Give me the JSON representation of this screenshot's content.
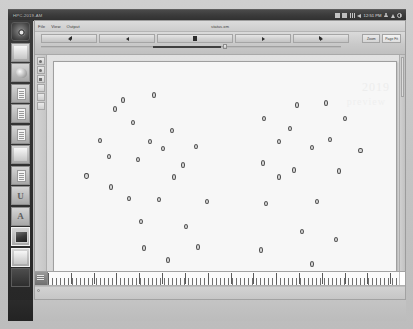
{
  "window": {
    "title": "HPC-2019-AM",
    "document_label": "status.xm"
  },
  "top_panel": {
    "tray": {
      "icons": [
        "grid-icon",
        "battery-icon",
        "signal-bars-icon",
        "volume-icon",
        "user-icon",
        "power-icon"
      ],
      "clock": "12:51 PM"
    }
  },
  "dock": {
    "items": [
      {
        "name": "dock-item-system-settings",
        "icon": "gear-dark-icon"
      },
      {
        "name": "dock-item-blank-1",
        "icon": "panel-icon"
      },
      {
        "name": "dock-item-media",
        "icon": "blob-icon"
      },
      {
        "name": "dock-item-document-1",
        "icon": "document-icon"
      },
      {
        "name": "dock-item-document-2",
        "icon": "document-icon"
      },
      {
        "name": "dock-item-document-3",
        "icon": "document-icon"
      },
      {
        "name": "dock-item-blank-2",
        "icon": "panel-icon"
      },
      {
        "name": "dock-item-text-editor",
        "icon": "text-icon"
      },
      {
        "name": "dock-item-letter-u",
        "icon": "letter-u-icon"
      },
      {
        "name": "dock-item-letter-a",
        "icon": "letter-a-icon"
      },
      {
        "name": "dock-item-photo",
        "icon": "photo-icon"
      },
      {
        "name": "dock-item-gradient",
        "icon": "gradient-icon"
      },
      {
        "name": "dock-item-terminal",
        "icon": "terminal-dark-icon"
      }
    ]
  },
  "menubar": {
    "items": [
      {
        "label": "File"
      },
      {
        "label": "View"
      },
      {
        "label": "Output"
      }
    ]
  },
  "transport": {
    "buttons": [
      {
        "name": "rewind-button",
        "icon": "rewind-icon",
        "label": ""
      },
      {
        "name": "previous-button",
        "icon": "previous-icon",
        "label": ""
      },
      {
        "name": "stop-button",
        "icon": "stop-icon",
        "label": ""
      },
      {
        "name": "next-button",
        "icon": "next-icon",
        "label": ""
      },
      {
        "name": "fast-forward-button",
        "icon": "fast-forward-icon",
        "label": ""
      }
    ],
    "right_buttons": [
      {
        "name": "zoom-button",
        "label": "Zoom"
      },
      {
        "name": "page-fit-button",
        "label": "Page Fit"
      }
    ],
    "scrubber": {
      "position_pct": 60
    }
  },
  "toolpalette": {
    "tools": [
      {
        "name": "tool-select",
        "icon": "pointer-icon"
      },
      {
        "name": "tool-zoom",
        "icon": "magnifier-icon"
      },
      {
        "name": "tool-marker",
        "icon": "marker-icon"
      },
      {
        "name": "tool-rect",
        "icon": "rectangle-icon"
      },
      {
        "name": "tool-hand",
        "icon": "hand-icon"
      },
      {
        "name": "tool-crop",
        "icon": "crop-icon"
      }
    ]
  },
  "timeline": {
    "head_icon": "timeline-head-icon",
    "major_ticks_pct": [
      0,
      6.5,
      13,
      19.5,
      26,
      32.5,
      39,
      45.5,
      52,
      58.5,
      65,
      71.5,
      78,
      84.5,
      91,
      97.5
    ]
  },
  "chart_data": {
    "type": "scatter",
    "title": "",
    "xlabel": "",
    "ylabel": "",
    "xlim": [
      0,
      100
    ],
    "ylim": [
      0,
      100
    ],
    "grid": false,
    "marker": {
      "shape": "circle",
      "outline": "#4e4e4e",
      "fill": "#d9d9d9",
      "size_px": 5
    },
    "series": [
      {
        "name": "cluster-left",
        "points": [
          [
            26.5,
            90.5
          ],
          [
            13.5,
            83.5
          ],
          [
            19.5,
            77.0
          ],
          [
            32.5,
            73.0
          ],
          [
            8.5,
            68.0
          ],
          [
            25.0,
            67.5
          ],
          [
            29.5,
            64.0
          ],
          [
            40.5,
            65.0
          ],
          [
            21.0,
            58.5
          ],
          [
            4.0,
            50.5
          ],
          [
            33.0,
            50.0
          ],
          [
            12.0,
            45.0
          ],
          [
            28.0,
            39.0
          ],
          [
            44.0,
            38.0
          ],
          [
            22.0,
            28.0
          ],
          [
            37.0,
            25.5
          ],
          [
            23.0,
            15.0
          ],
          [
            41.0,
            15.5
          ],
          [
            31.0,
            9.0
          ],
          [
            16.0,
            88.0
          ],
          [
            11.5,
            60.0
          ],
          [
            18.0,
            39.5
          ],
          [
            36.0,
            56.0
          ]
        ]
      },
      {
        "name": "cluster-right",
        "points": [
          [
            74.0,
            85.5
          ],
          [
            83.5,
            86.5
          ],
          [
            63.0,
            79.0
          ],
          [
            71.5,
            74.0
          ],
          [
            90.0,
            79.0
          ],
          [
            68.0,
            67.5
          ],
          [
            85.0,
            68.5
          ],
          [
            79.0,
            64.5
          ],
          [
            95.0,
            63.0
          ],
          [
            62.5,
            57.0
          ],
          [
            73.0,
            53.5
          ],
          [
            88.0,
            53.0
          ],
          [
            63.5,
            37.0
          ],
          [
            80.5,
            38.0
          ],
          [
            75.5,
            23.0
          ],
          [
            87.0,
            19.0
          ],
          [
            62.0,
            14.0
          ],
          [
            79.0,
            7.0
          ],
          [
            68.0,
            50.0
          ]
        ]
      }
    ]
  },
  "page_watermark": {
    "line1": "2019",
    "line2": "preview"
  }
}
